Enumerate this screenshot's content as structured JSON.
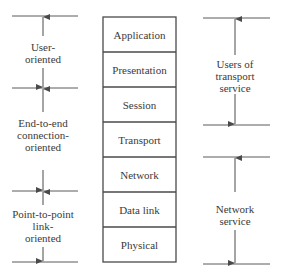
{
  "diagram": {
    "type": "osi-layer-groupings",
    "layers": [
      {
        "label": "Application"
      },
      {
        "label": "Presentation"
      },
      {
        "label": "Session"
      },
      {
        "label": "Transport"
      },
      {
        "label": "Network"
      },
      {
        "label": "Data link"
      },
      {
        "label": "Physical"
      }
    ],
    "left_groups": [
      {
        "label_lines": [
          "User-",
          "oriented"
        ]
      },
      {
        "label_lines": [
          "End-to-end",
          "connection-",
          "oriented"
        ]
      },
      {
        "label_lines": [
          "Point-to-point",
          "link-",
          "oriented"
        ]
      }
    ],
    "right_groups": [
      {
        "label_lines": [
          "Users of",
          "transport",
          "service"
        ]
      },
      {
        "label_lines": [
          "Network",
          "service"
        ]
      }
    ],
    "colors": {
      "line": "#4a4a4a",
      "text": "#3a3a3a",
      "background": "#ffffff"
    }
  }
}
